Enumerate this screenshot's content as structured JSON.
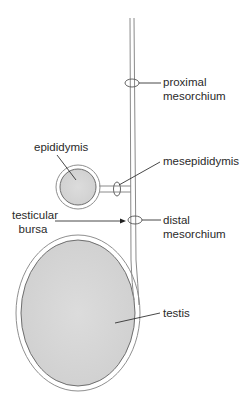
{
  "diagram": {
    "type": "anatomical-illustration",
    "colors": {
      "line": "#8a8a8a",
      "organ_fill": "#d6d6d6",
      "label_text": "#2a2a2a",
      "leader": "#333333"
    },
    "labels": {
      "proximal_mesorchium": [
        "proximal",
        "mesorchium"
      ],
      "epididymis": "epididymis",
      "mesepididymis": "mesepididymis",
      "testicular_bursa": [
        "testicular",
        "bursa"
      ],
      "distal_mesorchium": [
        "distal",
        "mesorchium"
      ],
      "testis": "testis"
    }
  }
}
